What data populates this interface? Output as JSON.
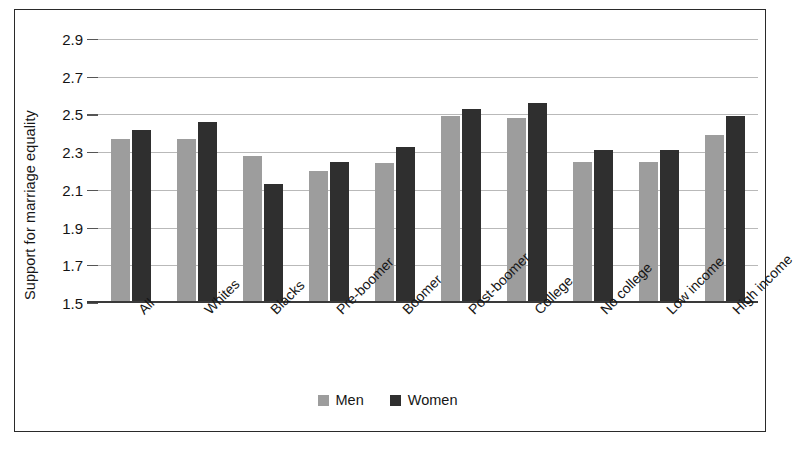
{
  "chart_data": {
    "type": "bar",
    "title": "",
    "xlabel": "",
    "ylabel": "Support for marriage equality",
    "ylim": [
      1.5,
      2.9
    ],
    "ytick_step": 0.2,
    "yticks": [
      "2.9",
      "2.7",
      "2.5",
      "2.3",
      "2.1",
      "1.9",
      "1.7",
      "1.5"
    ],
    "grid": true,
    "legend_position": "bottom-center",
    "categories": [
      "All",
      "Whites",
      "Blacks",
      "Pre-boomer",
      "Boomer",
      "Post-boomer",
      "College",
      "No college",
      "Low income",
      "High income"
    ],
    "series": [
      {
        "name": "Men",
        "color": "#9d9d9d",
        "values": [
          2.37,
          2.37,
          2.28,
          2.2,
          2.24,
          2.49,
          2.48,
          2.25,
          2.25,
          2.39
        ]
      },
      {
        "name": "Women",
        "color": "#2f2f2f",
        "values": [
          2.42,
          2.46,
          2.13,
          2.25,
          2.33,
          2.53,
          2.56,
          2.31,
          2.31,
          2.49
        ]
      }
    ]
  },
  "legend": {
    "items": [
      {
        "label": "Men",
        "color": "#9d9d9d"
      },
      {
        "label": "Women",
        "color": "#2f2f2f"
      }
    ]
  },
  "colors": {
    "men": "#9d9d9d",
    "women": "#2f2f2f",
    "gridline": "#b9b9b9",
    "axis": "#3a3a3a",
    "frame": "#2a2a2a",
    "background": "#ffffff"
  }
}
